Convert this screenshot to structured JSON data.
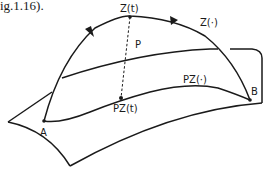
{
  "caption": "ig.1.16).",
  "labels": {
    "z_t": "Z(t)",
    "z_dot": "Z(·)",
    "p": "P",
    "pz_t": "PZ(t)",
    "pz_dot": "PZ(·)",
    "a": "A",
    "b": "B"
  },
  "colors": {
    "stroke": "#1a1a1a",
    "background": "#ffffff"
  }
}
